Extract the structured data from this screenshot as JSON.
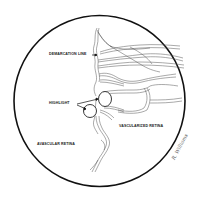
{
  "diagram": {
    "type": "retinal-fundus-illustration",
    "colors": {
      "background": "#ffffff",
      "outline": "#111111",
      "vessel": "#555555"
    },
    "labels": {
      "demarcation_line": "DEMARCATION LINE",
      "highlight": "HIGHLIGHT",
      "avascular_retina": "AVASCULAR RETINA",
      "vascularized_retina": "VASCULARIZED RETINA"
    },
    "signature": "R. Williams"
  }
}
